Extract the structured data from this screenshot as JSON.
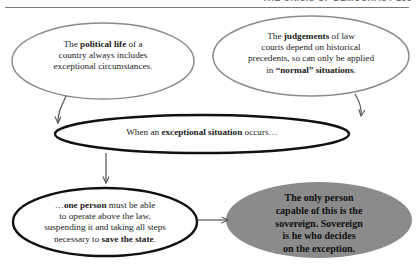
{
  "header": {
    "title": "THE CRISIS OF DEMOCRACY  153",
    "rule_color": "#7a7a7a"
  },
  "diagram": {
    "type": "flow-diagram",
    "colors": {
      "thin_outline": "#8a8a8a",
      "thick_outline": "#111111",
      "fill_gray": "#8b8b8b",
      "text": "#1b1b1b",
      "arrow": "#5a5a5a"
    },
    "nodes": [
      {
        "id": "premise-political-life",
        "name": "premise-political-life",
        "shape": "ellipse",
        "style": "thin-outline",
        "text_html": "The <b>political life</b> of a<br>country always includes<br>exceptional circumstances."
      },
      {
        "id": "premise-judgements",
        "name": "premise-judgements",
        "shape": "ellipse",
        "style": "thin-outline",
        "text_html": "The <b>judgements</b> of law<br>courts depend on historical<br>precedents, so can only be applied<br>in <b>&ldquo;normal&rdquo; situations</b>."
      },
      {
        "id": "condition-exception",
        "name": "condition-exceptional-situation",
        "shape": "ellipse",
        "style": "thick-outline",
        "text_html": "When an <b>exceptional situation</b> occurs&hellip;"
      },
      {
        "id": "consequence-one-person",
        "name": "consequence-one-person",
        "shape": "ellipse",
        "style": "thick-outline",
        "text_html": "&hellip;<b>one person</b> must be able<br>to operate above the law,<br>suspending it and taking all steps<br>necessary to <b>save the state</b>."
      },
      {
        "id": "conclusion-sovereign",
        "name": "conclusion-sovereign",
        "shape": "ellipse",
        "style": "gray-filled",
        "text_html": "The only person<br>capable of this is the<br>sovereign. Sovereign<br>is he who decides<br>on the exception."
      }
    ],
    "edges": [
      {
        "name": "arrow-premise1-to-condition",
        "from": "premise-political-life",
        "to": "condition-exception",
        "direction": "down"
      },
      {
        "name": "arrow-premise2-to-condition",
        "from": "premise-judgements",
        "to": "condition-exception",
        "direction": "down"
      },
      {
        "name": "arrow-condition-to-consequence",
        "from": "condition-exception",
        "to": "consequence-one-person",
        "direction": "down"
      },
      {
        "name": "arrow-consequence-to-conclusion",
        "from": "consequence-one-person",
        "to": "conclusion-sovereign",
        "direction": "right"
      }
    ]
  }
}
